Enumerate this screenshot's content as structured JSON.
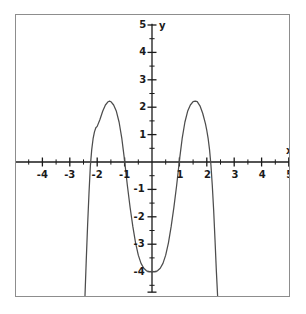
{
  "chart_data": {
    "type": "line",
    "title": "",
    "subtitle": "",
    "xlabel": "x",
    "ylabel": "y",
    "xlim": [
      -5,
      5
    ],
    "ylim": [
      -5,
      5
    ],
    "grid": false,
    "legend": null,
    "x_ticks": [
      -4,
      -3,
      -2,
      -1,
      1,
      2,
      3,
      4,
      5
    ],
    "x_tick_labels": [
      "-4",
      "-3",
      "-2",
      "-1",
      "1",
      "2",
      "3",
      "4",
      "5"
    ],
    "y_ticks": [
      5,
      4,
      3,
      2,
      1,
      -1,
      -2,
      -3,
      -4
    ],
    "y_tick_labels": [
      "5",
      "4",
      "3",
      "2",
      "1",
      "-1",
      "-2",
      "-3",
      "-4"
    ],
    "minor_ticks": true,
    "minor_tick_step": 0.5,
    "axis_color": "#1a1a1a",
    "curve_color": "#4d4d4d",
    "background": "#ffffff",
    "border_color": "#8d8d8d",
    "series": [
      {
        "name": "curve",
        "points": [
          [
            -2.45,
            -5.0
          ],
          [
            -2.4,
            -3.6
          ],
          [
            -2.35,
            -2.3
          ],
          [
            -2.3,
            -1.15
          ],
          [
            -2.25,
            -0.15
          ],
          [
            -2.2,
            0.45
          ],
          [
            -2.15,
            0.85
          ],
          [
            -2.1,
            1.1
          ],
          [
            -2.05,
            1.25
          ],
          [
            -2.0,
            1.3
          ],
          [
            -1.9,
            1.55
          ],
          [
            -1.8,
            1.85
          ],
          [
            -1.7,
            2.08
          ],
          [
            -1.6,
            2.2
          ],
          [
            -1.55,
            2.22
          ],
          [
            -1.5,
            2.2
          ],
          [
            -1.4,
            2.08
          ],
          [
            -1.3,
            1.85
          ],
          [
            -1.2,
            1.45
          ],
          [
            -1.1,
            0.85
          ],
          [
            -1.05,
            0.45
          ],
          [
            -1.0,
            0.05
          ],
          [
            -0.95,
            -0.4
          ],
          [
            -0.9,
            -0.85
          ],
          [
            -0.8,
            -1.65
          ],
          [
            -0.7,
            -2.35
          ],
          [
            -0.6,
            -2.95
          ],
          [
            -0.5,
            -3.4
          ],
          [
            -0.4,
            -3.7
          ],
          [
            -0.3,
            -3.88
          ],
          [
            -0.2,
            -3.97
          ],
          [
            -0.1,
            -4.0
          ],
          [
            0.0,
            -4.0
          ],
          [
            0.1,
            -4.0
          ],
          [
            0.2,
            -3.97
          ],
          [
            0.3,
            -3.88
          ],
          [
            0.4,
            -3.7
          ],
          [
            0.5,
            -3.4
          ],
          [
            0.6,
            -2.95
          ],
          [
            0.7,
            -2.35
          ],
          [
            0.8,
            -1.65
          ],
          [
            0.9,
            -0.85
          ],
          [
            0.95,
            -0.4
          ],
          [
            1.0,
            0.05
          ],
          [
            1.05,
            0.45
          ],
          [
            1.1,
            0.85
          ],
          [
            1.2,
            1.45
          ],
          [
            1.3,
            1.85
          ],
          [
            1.4,
            2.08
          ],
          [
            1.5,
            2.2
          ],
          [
            1.58,
            2.22
          ],
          [
            1.65,
            2.2
          ],
          [
            1.75,
            2.05
          ],
          [
            1.85,
            1.78
          ],
          [
            1.95,
            1.4
          ],
          [
            2.0,
            1.15
          ],
          [
            2.05,
            0.85
          ],
          [
            2.1,
            0.45
          ],
          [
            2.15,
            -0.1
          ],
          [
            2.2,
            -0.85
          ],
          [
            2.25,
            -1.75
          ],
          [
            2.3,
            -2.85
          ],
          [
            2.35,
            -4.0
          ],
          [
            2.4,
            -5.0
          ]
        ]
      }
    ],
    "annotations": [
      {
        "name": "left-peak",
        "x": -1.55,
        "y": 2.2
      },
      {
        "name": "right-peak",
        "x": 1.58,
        "y": 2.2
      },
      {
        "name": "minimum",
        "x": 0,
        "y": -4
      }
    ]
  }
}
